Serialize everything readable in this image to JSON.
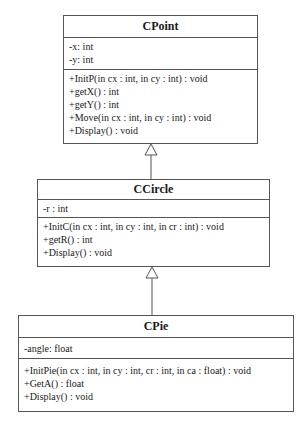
{
  "diagram": {
    "type": "uml-class-inheritance",
    "classes": [
      {
        "name": "CPoint",
        "attributes": [
          "-x: int",
          "-y: int"
        ],
        "operations": [
          "+InitP(in cx : int, in cy : int) : void",
          "+getX() : int",
          "+getY() : int",
          "+Move(in cx : int, in cy : int) : void",
          "+Display() : void"
        ]
      },
      {
        "name": "CCircle",
        "attributes": [
          "-r : int"
        ],
        "operations": [
          "+InitC(in cx : int, in cy : int, in cr : int) : void",
          "+getR() : int",
          "+Display() : void"
        ]
      },
      {
        "name": "CPie",
        "attributes": [
          "-angle: float"
        ],
        "operations": [
          "+InitPie(in cx : int, in cy : int, cr : int, in ca : float) : void",
          "+GetA() : float",
          "+Display() : void"
        ]
      }
    ],
    "relationships": [
      {
        "type": "generalization",
        "from": "CCircle",
        "to": "CPoint"
      },
      {
        "type": "generalization",
        "from": "CPie",
        "to": "CCircle"
      }
    ],
    "colors": {
      "border": "#555555",
      "background": "#ffffff",
      "text": "#1a1a1a"
    }
  }
}
